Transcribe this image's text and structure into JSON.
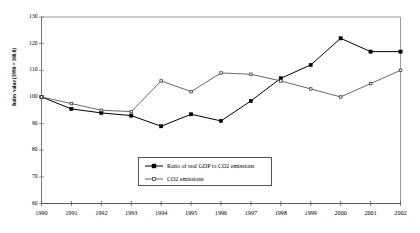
{
  "chart_data": {
    "type": "line",
    "title": "",
    "xlabel": "",
    "ylabel": "Index value (1990 = 100.0)",
    "categories": [
      "1990",
      "1991",
      "1992",
      "1993",
      "1994",
      "1995",
      "1996",
      "1997",
      "1998",
      "1999",
      "2000",
      "2001",
      "2002"
    ],
    "x": [
      1990,
      1991,
      1992,
      1993,
      1994,
      1995,
      1996,
      1997,
      1998,
      1999,
      2000,
      2001,
      2002
    ],
    "ylim": [
      60,
      130
    ],
    "yticks": [
      60,
      70,
      80,
      90,
      100,
      110,
      120,
      130
    ],
    "grid": false,
    "legend_position": "inside-bottom-center",
    "series": [
      {
        "name": "Ratio of real GDP to CO2 emissions",
        "marker": "filled-square",
        "color": "#000000",
        "values": [
          100,
          95.5,
          94,
          93,
          89,
          93.5,
          91,
          98.5,
          107,
          112,
          122,
          117,
          117
        ]
      },
      {
        "name": "CO2 emissions",
        "marker": "hollow-small",
        "color": "#4d4d4d",
        "values": [
          100,
          97.5,
          95,
          94.5,
          106,
          102,
          109,
          108.5,
          106,
          103,
          100,
          105,
          110
        ]
      }
    ]
  },
  "axis": {
    "y_title": "Index value (1990 = 100.0)",
    "y_tick_labels": [
      "130",
      "120",
      "110",
      "100",
      "90",
      "80",
      "70",
      "60"
    ],
    "x_tick_labels": [
      "1990",
      "1991",
      "1992",
      "1993",
      "1994",
      "1995",
      "1996",
      "1997",
      "1998",
      "1999",
      "2000",
      "2001",
      "2002"
    ]
  },
  "legend": {
    "items": [
      {
        "label": "Ratio of real GDP to CO2 emissions"
      },
      {
        "label": "CO2 emissions"
      }
    ]
  }
}
